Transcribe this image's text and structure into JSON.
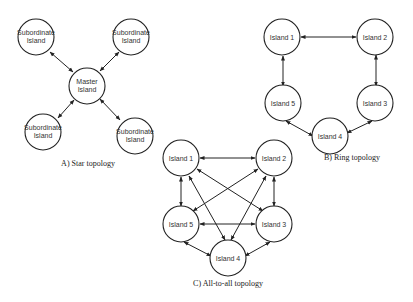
{
  "diagrams": {
    "star": {
      "caption": "A) Star topology",
      "master": "Master Island",
      "subordinate": "Subordinate Island"
    },
    "ring": {
      "caption": "B) Ring topology",
      "nodes": [
        "Island 1",
        "Island 2",
        "Island 3",
        "Island 4",
        "Island 5"
      ]
    },
    "all_to_all": {
      "caption": "C) All-to-all topology",
      "nodes": [
        "Island 1",
        "Island 2",
        "Island 3",
        "Island 4",
        "Island 5"
      ]
    }
  }
}
